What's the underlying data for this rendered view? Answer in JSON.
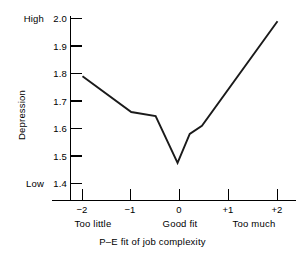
{
  "chart_data": {
    "type": "line",
    "title": "",
    "xlabel": "P–E fit of job complexity",
    "ylabel": "Depression",
    "xlim": [
      -2.25,
      2.25
    ],
    "ylim": [
      1.35,
      2.02
    ],
    "grid": false,
    "legend": "none",
    "x_tick_labels": [
      "−2",
      "−1",
      "0",
      "+1",
      "+2"
    ],
    "x_tick_values": [
      -2,
      -1,
      0,
      1,
      2
    ],
    "x_category_labels": [
      "Too little",
      "Good fit",
      "Too much"
    ],
    "x_category_values": [
      -2,
      0,
      1
    ],
    "y_tick_labels": [
      "2.0",
      "1.9",
      "1.8",
      "1.7",
      "1.6",
      "1.5",
      "1.4"
    ],
    "y_tick_values": [
      2.0,
      1.9,
      1.8,
      1.7,
      1.6,
      1.5,
      1.4
    ],
    "y_anchor_high": "High",
    "y_anchor_low": "Low",
    "series": [
      {
        "name": "Depression",
        "color": "#1a1a1a",
        "x": [
          -2.0,
          -1.0,
          -0.5,
          -0.05,
          0.2,
          0.45,
          2.0
        ],
        "values": [
          1.79,
          1.66,
          1.645,
          1.475,
          1.58,
          1.61,
          1.99
        ]
      }
    ]
  }
}
